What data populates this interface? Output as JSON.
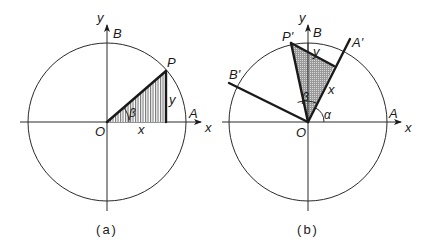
{
  "figure": {
    "panels": [
      {
        "id": "a",
        "caption": "(a)",
        "labels": {
          "y_axis": "y",
          "x_axis": "x",
          "origin": "O",
          "point_b": "B",
          "point_a": "A",
          "point_p": "P",
          "side_x": "x",
          "side_y": "y",
          "angle": "β"
        }
      },
      {
        "id": "b",
        "caption": "(b)",
        "labels": {
          "y_axis": "y",
          "x_axis": "x",
          "origin": "O",
          "point_b": "B",
          "point_a": "A",
          "point_p_prime": "P'",
          "point_a_prime": "A'",
          "point_b_prime": "B'",
          "side_x": "x",
          "side_y": "y",
          "angle_beta": "β",
          "angle_alpha": "α"
        }
      }
    ],
    "colors": {
      "line": "#1a1a1a",
      "hatch": "#555555",
      "background": "#ffffff"
    }
  }
}
